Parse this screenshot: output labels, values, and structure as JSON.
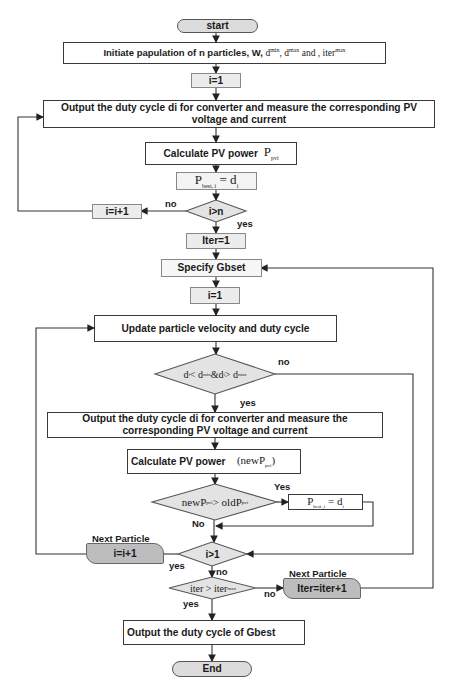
{
  "flowchart": {
    "start": "start",
    "init": {
      "text": "Initiate papulation of n particles, W,",
      "dmin": "d",
      "dmin_sup": "min",
      "sep1": ", d",
      "dmax_sup": "max",
      "and": " and , iter",
      "iter_sup": "max"
    },
    "i_eq_1": "i=1",
    "output1": "Output the duty cycle di for converter and measure the corresponding PV voltage and current",
    "calc1": {
      "text": "Calculate PV power",
      "sym": "P",
      "sub": "pvi"
    },
    "pbest1": {
      "sym": "P",
      "sub": "best, i",
      "eq": " = d",
      "eq_sub": "i"
    },
    "dec_i_gt_n": "i>n",
    "i_inc": "i=i+1",
    "iter_eq_1": "Iter=1",
    "specify": "Specify Gbset",
    "i_eq_1b": "i=1",
    "update": "Update particle velocity and duty cycle",
    "dec_bounds": {
      "d1": "d",
      "d1_sub": "i",
      "lt": " < d",
      "lt_sup": "min",
      "amp": "&d",
      "d2_sub": "i",
      "gt": " > d",
      "gt_sup": "max"
    },
    "output2": "Output the duty cycle di for converter and measure the corresponding PV voltage and current",
    "calc2": {
      "text": "Calculate PV power",
      "sym": "(newP",
      "sub": "pvi",
      "close": ")"
    },
    "dec_power": {
      "lhs": "newP",
      "lhs_sub": "pvi",
      "op": " > oldP",
      "rhs_sub": "pvi"
    },
    "pbest2": {
      "sym": "P",
      "sub": "best ,i",
      "eq": " = d",
      "eq_sub": "i"
    },
    "dec_i_gt_1": "i>1",
    "next_particle_1": "Next Particle",
    "i_inc_2": "i=i+1",
    "dec_iter": {
      "lhs": "iter > iter",
      "sup": "max"
    },
    "next_particle_2": "Next Particle",
    "iter_inc": "Iter=iter+1",
    "output_gbest": "Output the duty cycle of Gbest",
    "end": "End"
  },
  "labels": {
    "no_1": "no",
    "yes_1": "yes",
    "no_2": "no",
    "yes_2": "yes",
    "yes_3": "Yes",
    "no_3": "No",
    "yes_4": "yes",
    "no_4": "no",
    "no_5": "no",
    "yes_5": "yes"
  }
}
